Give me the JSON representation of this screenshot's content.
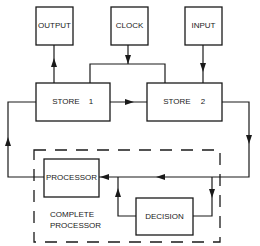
{
  "diagram": {
    "nodes": {
      "output": {
        "label": "OUTPUT"
      },
      "clock": {
        "label": "CLOCK"
      },
      "input": {
        "label": "INPUT"
      },
      "store1": {
        "label": "STORE",
        "number": "1"
      },
      "store2": {
        "label": "STORE",
        "number": "2"
      },
      "processor": {
        "label": "PROCESSOR"
      },
      "decision": {
        "label": "DECISION"
      }
    },
    "group": {
      "label_line1": "COMPLETE",
      "label_line2": "PROCESSOR"
    },
    "edges": [
      {
        "from": "store1",
        "to": "output"
      },
      {
        "from": "clock",
        "to": "store1"
      },
      {
        "from": "clock",
        "to": "store2"
      },
      {
        "from": "input",
        "to": "store2"
      },
      {
        "from": "store1",
        "to": "store2"
      },
      {
        "from": "store2",
        "to": "processor"
      },
      {
        "from": "store2",
        "to": "decision"
      },
      {
        "from": "decision",
        "to": "processor"
      },
      {
        "from": "processor",
        "to": "store1"
      }
    ]
  }
}
